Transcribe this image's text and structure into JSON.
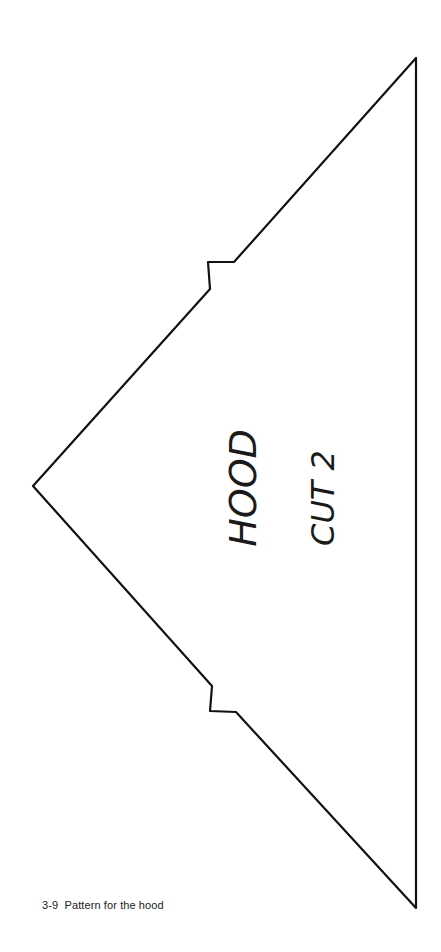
{
  "figure": {
    "caption": "3-9  Pattern for the hood",
    "piece": {
      "name_label": "HOOD",
      "cut_instruction": "CUT 2"
    },
    "colors": {
      "line": "#111111",
      "background": "#ffffff"
    }
  }
}
